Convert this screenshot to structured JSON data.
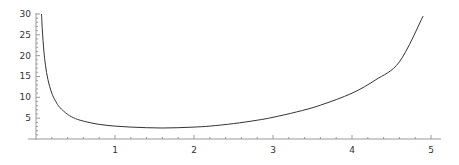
{
  "chart_data": {
    "type": "line",
    "title": "",
    "xlabel": "",
    "ylabel": "",
    "xlim": [
      0,
      5.05
    ],
    "ylim": [
      0,
      30
    ],
    "grid": false,
    "legend": null,
    "x_ticks": [
      1,
      2,
      3,
      4,
      5
    ],
    "y_ticks": [
      5,
      10,
      15,
      20,
      25,
      30
    ],
    "series": [
      {
        "name": "f(x)",
        "color": "#333333",
        "x": [
          0.07,
          0.08,
          0.1,
          0.12,
          0.15,
          0.2,
          0.25,
          0.3,
          0.4,
          0.5,
          0.6,
          0.8,
          1.0,
          1.2,
          1.4,
          1.6,
          1.8,
          2.0,
          2.2,
          2.5,
          2.8,
          3.0,
          3.3,
          3.6,
          4.0,
          4.3,
          4.6,
          4.9
        ],
        "values": [
          30,
          26.2,
          21.1,
          17.7,
          14.3,
          11.0,
          9.0,
          7.6,
          5.9,
          4.9,
          4.3,
          3.5,
          3.1,
          2.85,
          2.7,
          2.65,
          2.7,
          2.85,
          3.1,
          3.7,
          4.5,
          5.2,
          6.5,
          8.1,
          11.0,
          14.2,
          18.5,
          29.5
        ]
      }
    ]
  }
}
